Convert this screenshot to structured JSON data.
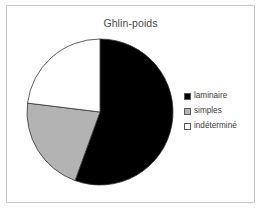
{
  "chart_data": {
    "type": "pie",
    "title": "Ghlin-poids",
    "xlabel": "",
    "ylabel": "",
    "grid": false,
    "legend_position": "right",
    "start_angle_deg": 0,
    "direction": "clockwise",
    "categories": [
      "laminaire",
      "simples",
      "indéterminé"
    ],
    "values": [
      55.5,
      21.4,
      23.1
    ],
    "slices": [
      {
        "label": "laminaire",
        "value": 55.5,
        "color": "#000000",
        "start_angle_deg": 0,
        "end_angle_deg": 200
      },
      {
        "label": "simples",
        "value": 21.4,
        "color": "#b3b3b3",
        "start_angle_deg": 200,
        "end_angle_deg": 277
      },
      {
        "label": "indéterminé",
        "value": 23.1,
        "color": "#ffffff",
        "start_angle_deg": 277,
        "end_angle_deg": 360
      }
    ]
  },
  "frame": {
    "border_color": "#c9c9c9",
    "background_color": "#ffffff"
  },
  "title": {
    "text": "Ghlin-poids",
    "color": "#4a4a4a"
  },
  "pie": {
    "center_x": 80,
    "center_y": 80,
    "radius": 73,
    "outline_color": "#333333"
  },
  "legend": {
    "items": [
      {
        "label": "laminaire",
        "color": "#000000"
      },
      {
        "label": "simples",
        "color": "#b3b3b3"
      },
      {
        "label": "indéterminé",
        "color": "#ffffff"
      }
    ]
  }
}
